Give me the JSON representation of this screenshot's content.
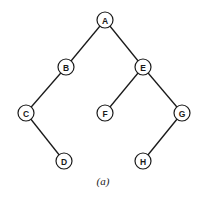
{
  "diagram": {
    "type": "binary-tree",
    "caption": "(a)",
    "colors": {
      "stroke": "#1a1a1a",
      "node_fill": "#ffffff",
      "background": "#ffffff"
    },
    "nodes": [
      {
        "id": "A",
        "label": "A",
        "x": 105,
        "y": 20
      },
      {
        "id": "B",
        "label": "B",
        "x": 66,
        "y": 67
      },
      {
        "id": "E",
        "label": "E",
        "x": 143,
        "y": 67
      },
      {
        "id": "C",
        "label": "C",
        "x": 26,
        "y": 113
      },
      {
        "id": "F",
        "label": "F",
        "x": 105,
        "y": 113
      },
      {
        "id": "G",
        "label": "G",
        "x": 182,
        "y": 113
      },
      {
        "id": "D",
        "label": "D",
        "x": 64,
        "y": 161
      },
      {
        "id": "H",
        "label": "H",
        "x": 143,
        "y": 161
      }
    ],
    "edges": [
      {
        "from": "A",
        "to": "B"
      },
      {
        "from": "A",
        "to": "E"
      },
      {
        "from": "B",
        "to": "C"
      },
      {
        "from": "E",
        "to": "F"
      },
      {
        "from": "E",
        "to": "G"
      },
      {
        "from": "C",
        "to": "D"
      },
      {
        "from": "G",
        "to": "H"
      }
    ]
  }
}
